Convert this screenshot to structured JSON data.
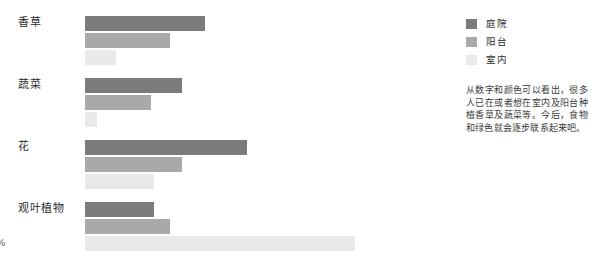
{
  "chart_data": {
    "type": "bar",
    "orientation": "horizontal",
    "title": "",
    "xlabel": "",
    "ylabel": "",
    "xlim": [
      0,
      70
    ],
    "grid": false,
    "legend_position": "right",
    "categories": [
      "香草",
      "蔬菜",
      "花",
      "观叶植物"
    ],
    "series": [
      {
        "name": "庭院",
        "color": "#7b7b7b",
        "values": [
          31,
          25,
          42,
          18
        ],
        "labels": [
          "31%",
          "25%",
          "42%",
          "18%"
        ]
      },
      {
        "name": "阳台",
        "color": "#a9a9a9",
        "values": [
          22,
          17,
          25,
          22
        ],
        "labels": [
          "22%",
          "17%",
          "25%",
          "22%"
        ]
      },
      {
        "name": "室内",
        "color": "#e9e9e9",
        "values": [
          8,
          3,
          18,
          70
        ],
        "labels": [
          "8%",
          "3%",
          "18%",
          "70%"
        ]
      }
    ]
  },
  "chart": {
    "groups": [
      {
        "label": "香草",
        "bars": [
          {
            "series": "庭院",
            "label": "31%",
            "value": 31,
            "color": "#7b7b7b",
            "label_style": "inside"
          },
          {
            "series": "阳台",
            "label": "22%",
            "value": 22,
            "color": "#a9a9a9",
            "label_style": "inside"
          },
          {
            "series": "室内",
            "label": "8%",
            "value": 8,
            "color": "#e9e9e9",
            "label_style": "inside-dark"
          }
        ]
      },
      {
        "label": "蔬菜",
        "bars": [
          {
            "series": "庭院",
            "label": "25%",
            "value": 25,
            "color": "#7b7b7b",
            "label_style": "inside"
          },
          {
            "series": "阳台",
            "label": "17%",
            "value": 17,
            "color": "#a9a9a9",
            "label_style": "inside"
          },
          {
            "series": "室内",
            "label": "3%",
            "value": 3,
            "color": "#e9e9e9",
            "label_style": "inside-faint"
          }
        ]
      },
      {
        "label": "花",
        "bars": [
          {
            "series": "庭院",
            "label": "42%",
            "value": 42,
            "color": "#7b7b7b",
            "label_style": "inside"
          },
          {
            "series": "阳台",
            "label": "25%",
            "value": 25,
            "color": "#a9a9a9",
            "label_style": "inside"
          },
          {
            "series": "室内",
            "label": "18%",
            "value": 18,
            "color": "#e9e9e9",
            "label_style": "inside-faint"
          }
        ]
      },
      {
        "label": "观叶植物",
        "bars": [
          {
            "series": "庭院",
            "label": "18%",
            "value": 18,
            "color": "#7b7b7b",
            "label_style": "inside"
          },
          {
            "series": "阳台",
            "label": "22%",
            "value": 22,
            "color": "#a9a9a9",
            "label_style": "inside"
          },
          {
            "series": "室内",
            "label": "70%",
            "value": 70,
            "color": "#e9e9e9",
            "label_style": "inside-dark"
          }
        ]
      }
    ]
  },
  "legend": {
    "items": [
      {
        "label": "庭院",
        "color": "#7b7b7b"
      },
      {
        "label": "阳台",
        "color": "#a9a9a9"
      },
      {
        "label": "室内",
        "color": "#e9e9e9"
      }
    ]
  },
  "note": {
    "text": "从数字和颜色可以看出，很多人已在或者想在室内及阳台种植香草及蔬菜等。今后，食物和绿色就会逐步联系起来吧。"
  }
}
